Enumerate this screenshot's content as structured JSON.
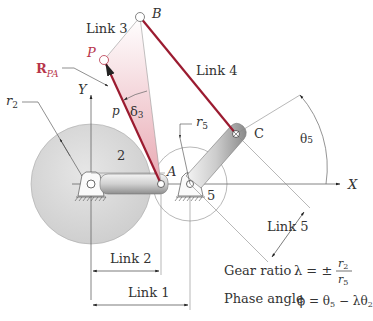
{
  "diagram": {
    "colors": {
      "link_red": "#9b1b30",
      "label_red": "#b8354a",
      "gear_fill": "#d8d8d8",
      "line_gray": "#888888",
      "triangle_fill": "#f3d0d5"
    },
    "labels": {
      "link3": "Link 3",
      "link4": "Link 4",
      "link5": "Link 5",
      "link2": "Link 2",
      "link1": "Link 1",
      "point_b": "B",
      "point_p": "P",
      "point_a": "A",
      "point_c": "C",
      "r_pa_main": "R",
      "r_pa_sub": "PA",
      "p": "p",
      "delta3": "δ",
      "delta3_sub": "3",
      "axis_y": "Y",
      "axis_x": "X",
      "r2": "r",
      "r2_sub": "2",
      "r5": "r",
      "r5_sub": "5",
      "gear2": "2",
      "gear5": "5",
      "theta5": "θ",
      "theta5_sub": "5"
    },
    "equations": {
      "gear_ratio_label": "Gear ratio",
      "gear_ratio_lhs": "λ = ±",
      "gear_ratio_num": "r",
      "gear_ratio_num_sub": "2",
      "gear_ratio_den": "r",
      "gear_ratio_den_sub": "5",
      "phase_angle_label": "Phase angle",
      "phase_angle_eq": "ϕ = θ",
      "phase_angle_sub1": "5",
      "phase_angle_mid": " − λθ",
      "phase_angle_sub2": "2"
    }
  }
}
